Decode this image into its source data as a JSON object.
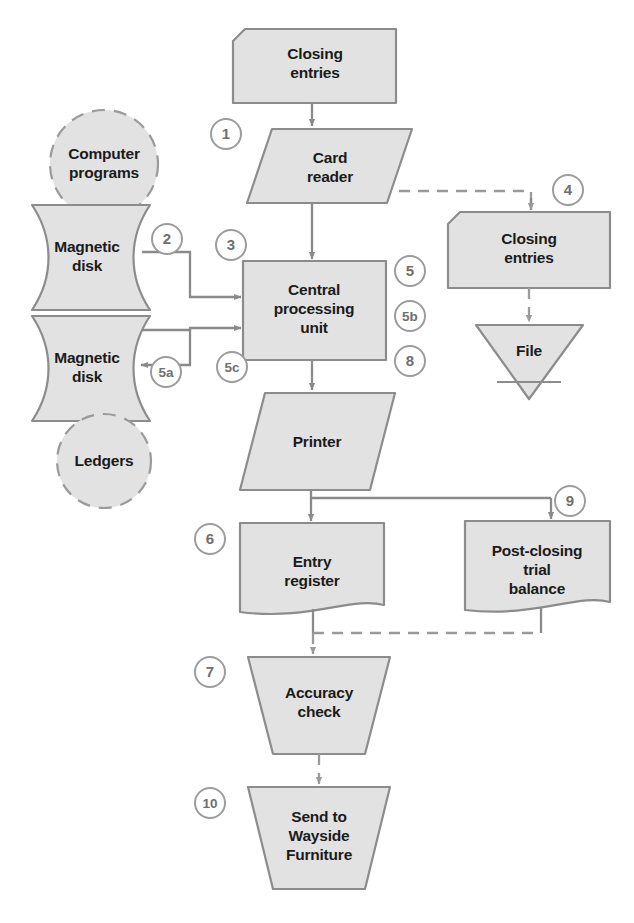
{
  "diagram": {
    "background_color": "#ffffff",
    "shape_fill": "#e2e2e2",
    "shape_stroke": "#8c8c8c",
    "connector_color": "#8a8a8a",
    "step_circle_color": "#9c9c9c",
    "label_color": "#1b1b1b"
  },
  "nodes": [
    {
      "id": "closing-entries-input",
      "label_lines": [
        "Closing",
        "entries"
      ],
      "shape": "clipped-corner-card",
      "step": null
    },
    {
      "id": "card-reader",
      "label_lines": [
        "Card",
        "reader"
      ],
      "shape": "parallelogram",
      "step": "1"
    },
    {
      "id": "computer-programs",
      "label_lines": [
        "Computer",
        "programs"
      ],
      "shape": "dashed-circle",
      "step": null
    },
    {
      "id": "magnetic-disk-upper",
      "label_lines": [
        "Magnetic",
        "disk"
      ],
      "shape": "magnetic-disk",
      "step": "2"
    },
    {
      "id": "magnetic-disk-lower",
      "label_lines": [
        "Magnetic",
        "disk"
      ],
      "shape": "magnetic-disk",
      "step": "5a"
    },
    {
      "id": "ledgers",
      "label_lines": [
        "Ledgers"
      ],
      "shape": "dashed-circle",
      "step": null
    },
    {
      "id": "central-processing-unit",
      "label_lines": [
        "Central",
        "processing",
        "unit"
      ],
      "shape": "rectangle",
      "step": "3"
    },
    {
      "id": "closing-entries-output",
      "label_lines": [
        "Closing",
        "entries"
      ],
      "shape": "clipped-corner-card",
      "step": "4"
    },
    {
      "id": "file",
      "label_lines": [
        "File"
      ],
      "shape": "inverted-triangle",
      "step": null
    },
    {
      "id": "printer",
      "label_lines": [
        "Printer"
      ],
      "shape": "parallelogram",
      "step": null
    },
    {
      "id": "entry-register",
      "label_lines": [
        "Entry",
        "register"
      ],
      "shape": "document",
      "step": "6"
    },
    {
      "id": "post-closing-trial-balance",
      "label_lines": [
        "Post-closing",
        "trial",
        "balance"
      ],
      "shape": "document",
      "step": "9"
    },
    {
      "id": "accuracy-check",
      "label_lines": [
        "Accuracy",
        "check"
      ],
      "shape": "trapezoid",
      "step": "7"
    },
    {
      "id": "send-to-wayside-furniture",
      "label_lines": [
        "Send to",
        "Wayside",
        "Furniture"
      ],
      "shape": "trapezoid",
      "step": "10"
    }
  ],
  "steps": [
    {
      "id": "step-1",
      "text": "1",
      "x": 226,
      "y": 134
    },
    {
      "id": "step-2",
      "text": "2",
      "x": 167,
      "y": 239
    },
    {
      "id": "step-3",
      "text": "3",
      "x": 231,
      "y": 245
    },
    {
      "id": "step-4",
      "text": "4",
      "x": 568,
      "y": 190
    },
    {
      "id": "step-5",
      "text": "5",
      "x": 410,
      "y": 271
    },
    {
      "id": "step-5b",
      "text": "5b",
      "x": 410,
      "y": 316
    },
    {
      "id": "step-8",
      "text": "8",
      "x": 410,
      "y": 361
    },
    {
      "id": "step-5a",
      "text": "5a",
      "x": 166,
      "y": 372
    },
    {
      "id": "step-5c",
      "text": "5c",
      "x": 232,
      "y": 367
    },
    {
      "id": "step-6",
      "text": "6",
      "x": 210,
      "y": 539
    },
    {
      "id": "step-9",
      "text": "9",
      "x": 570,
      "y": 501
    },
    {
      "id": "step-7",
      "text": "7",
      "x": 210,
      "y": 672
    },
    {
      "id": "step-10",
      "text": "10",
      "x": 210,
      "y": 803
    }
  ],
  "connectors": [
    {
      "id": "closing-to-card-reader",
      "style": "solid",
      "arrow": true
    },
    {
      "id": "card-reader-to-closing-entries-output",
      "style": "dashed",
      "arrow": true
    },
    {
      "id": "card-reader-to-cpu",
      "style": "solid",
      "arrow": true
    },
    {
      "id": "upper-disk-to-cpu",
      "style": "solid",
      "arrow": true
    },
    {
      "id": "lower-disk-to-cpu",
      "style": "solid",
      "arrow": true
    },
    {
      "id": "cpu-to-lower-disk",
      "style": "solid",
      "arrow": true
    },
    {
      "id": "closing-entries-output-to-file",
      "style": "dashed",
      "arrow": true
    },
    {
      "id": "cpu-to-printer",
      "style": "solid",
      "arrow": true
    },
    {
      "id": "printer-to-entry-register",
      "style": "solid",
      "arrow": true
    },
    {
      "id": "printer-to-post-closing-trial-balance",
      "style": "solid",
      "arrow": true
    },
    {
      "id": "entry-register-to-accuracy-check",
      "style": "dashed",
      "arrow": true
    },
    {
      "id": "post-closing-to-accuracy-check",
      "style": "dashed",
      "arrow": false
    },
    {
      "id": "accuracy-check-to-send",
      "style": "dashed",
      "arrow": true
    }
  ]
}
